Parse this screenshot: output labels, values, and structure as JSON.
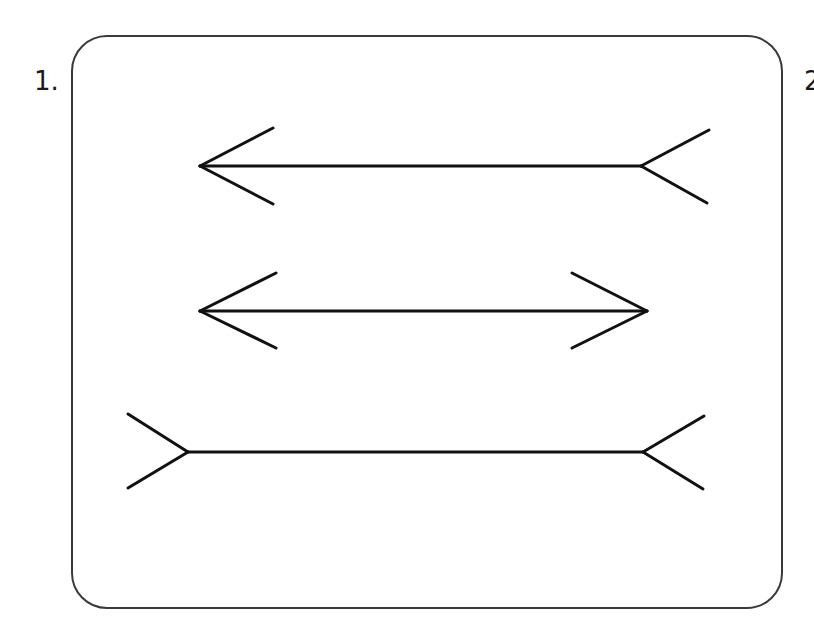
{
  "figure": {
    "labels": [
      "1.",
      "2."
    ],
    "stroke_color": "#111111",
    "frame_color": "#3a3a3a",
    "background": "#ffffff"
  },
  "lines": [
    {
      "id": "line-1",
      "description": "left arrowhead pointing out, right fins pointing out (tail)",
      "y": 166,
      "x1": 200,
      "x2": 641,
      "left_end": "arrowhead-out",
      "right_end": "fork-out",
      "fins": [
        [
          200,
          166,
          273,
          128
        ],
        [
          200,
          166,
          273,
          204
        ],
        [
          641,
          166,
          709,
          130
        ],
        [
          641,
          166,
          707,
          203
        ]
      ]
    },
    {
      "id": "line-2",
      "description": "double-headed arrow, both arrowheads pointing out",
      "y": 311,
      "x1": 200,
      "x2": 647,
      "left_end": "arrowhead-out",
      "right_end": "arrowhead-out",
      "fins": [
        [
          200,
          311,
          276,
          273
        ],
        [
          200,
          311,
          276,
          348
        ],
        [
          647,
          311,
          572,
          273
        ],
        [
          647,
          311,
          572,
          348
        ]
      ]
    },
    {
      "id": "line-3",
      "description": "both ends with outward forks (fins pointing out)",
      "y": 452,
      "x1": 188,
      "x2": 643,
      "left_end": "fork-out",
      "right_end": "fork-out",
      "fins": [
        [
          188,
          452,
          128,
          414
        ],
        [
          188,
          452,
          128,
          488
        ],
        [
          643,
          452,
          704,
          416
        ],
        [
          643,
          452,
          703,
          489
        ]
      ]
    }
  ]
}
